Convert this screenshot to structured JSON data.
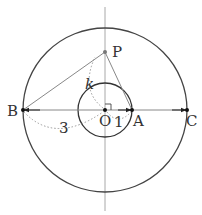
{
  "diagram": {
    "type": "geometry",
    "center": {
      "label": "O",
      "x": 105,
      "y": 110
    },
    "inner_circle": {
      "radius_px": 27,
      "radius_value": "1"
    },
    "outer_circle": {
      "radius_px": 82,
      "radius_value": "3"
    },
    "points": {
      "P": {
        "label": "P",
        "x": 105,
        "y": 52
      },
      "A": {
        "label": "A",
        "x": 132,
        "y": 110
      },
      "B": {
        "label": "B",
        "x": 23,
        "y": 110
      },
      "C": {
        "label": "C",
        "x": 187,
        "y": 110
      },
      "O": {
        "label": "O",
        "x": 105,
        "y": 110
      }
    },
    "measure_labels": {
      "k": "k",
      "one": "1",
      "three": "3"
    },
    "colors": {
      "circle": "#333333",
      "axis": "#999999",
      "segment": "#777777",
      "dotted": "#888888",
      "point": "#111111"
    }
  }
}
